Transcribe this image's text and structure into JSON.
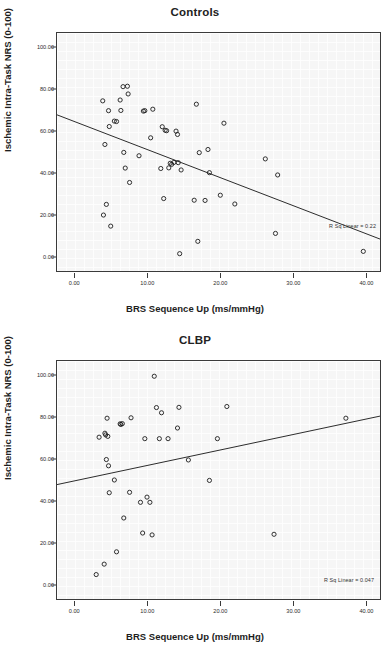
{
  "figure": {
    "axis_x_label": "BRS Sequence Up (ms/mmHg)",
    "axis_y_label": "Ischemic Intra-Task NRS (0-100)",
    "xticks": [
      "0.00",
      "10.00",
      "20.00",
      "30.00",
      "40.00"
    ],
    "yticks": [
      "0.00",
      "20.00",
      "40.00",
      "60.00",
      "80.00",
      "100.00"
    ]
  },
  "chart_data": [
    {
      "type": "scatter",
      "title": "Controls",
      "xlabel": "BRS Sequence Up (ms/mmHg)",
      "ylabel": "Ischemic Intra-Task NRS (0-100)",
      "xlim": [
        -2.5,
        42.0
      ],
      "ylim": [
        -7.0,
        107.0
      ],
      "xticks": [
        0,
        10,
        20,
        30,
        40
      ],
      "yticks": [
        0,
        20,
        40,
        60,
        80,
        100
      ],
      "grid": true,
      "annotation": "R Sq Linear = 0.22",
      "fit_line": {
        "x0": -2.5,
        "y0": 67.8,
        "x1": 42.0,
        "y1": 8.3
      },
      "points": [
        {
          "x": 3.8,
          "y": 74.5
        },
        {
          "x": 3.9,
          "y": 19.8
        },
        {
          "x": 4.1,
          "y": 53.6
        },
        {
          "x": 4.3,
          "y": 24.9
        },
        {
          "x": 4.6,
          "y": 69.8
        },
        {
          "x": 4.7,
          "y": 62.2
        },
        {
          "x": 4.9,
          "y": 14.5
        },
        {
          "x": 5.4,
          "y": 64.8
        },
        {
          "x": 5.7,
          "y": 64.6
        },
        {
          "x": 6.2,
          "y": 74.9
        },
        {
          "x": 6.3,
          "y": 69.9
        },
        {
          "x": 6.6,
          "y": 81.3
        },
        {
          "x": 6.7,
          "y": 49.8
        },
        {
          "x": 6.9,
          "y": 42.3
        },
        {
          "x": 7.2,
          "y": 81.5
        },
        {
          "x": 7.3,
          "y": 77.8
        },
        {
          "x": 7.5,
          "y": 35.4
        },
        {
          "x": 8.8,
          "y": 48.2
        },
        {
          "x": 9.4,
          "y": 69.6
        },
        {
          "x": 9.6,
          "y": 69.8
        },
        {
          "x": 10.4,
          "y": 56.8
        },
        {
          "x": 10.7,
          "y": 70.5
        },
        {
          "x": 11.8,
          "y": 42.1
        },
        {
          "x": 12.0,
          "y": 62.1
        },
        {
          "x": 12.2,
          "y": 27.7
        },
        {
          "x": 12.4,
          "y": 60.4
        },
        {
          "x": 12.6,
          "y": 60.2
        },
        {
          "x": 12.9,
          "y": 42.4
        },
        {
          "x": 13.1,
          "y": 44.6
        },
        {
          "x": 13.3,
          "y": 44.1
        },
        {
          "x": 13.6,
          "y": 45.0
        },
        {
          "x": 13.9,
          "y": 60.0
        },
        {
          "x": 14.1,
          "y": 58.4
        },
        {
          "x": 14.2,
          "y": 44.9
        },
        {
          "x": 14.4,
          "y": 1.3
        },
        {
          "x": 14.6,
          "y": 41.4
        },
        {
          "x": 16.4,
          "y": 26.9
        },
        {
          "x": 16.7,
          "y": 72.9
        },
        {
          "x": 16.9,
          "y": 7.2
        },
        {
          "x": 17.1,
          "y": 49.7
        },
        {
          "x": 17.9,
          "y": 26.8
        },
        {
          "x": 18.3,
          "y": 51.2
        },
        {
          "x": 18.5,
          "y": 40.1
        },
        {
          "x": 20.0,
          "y": 29.3
        },
        {
          "x": 20.5,
          "y": 63.8
        },
        {
          "x": 22.0,
          "y": 25.1
        },
        {
          "x": 26.2,
          "y": 46.7
        },
        {
          "x": 27.6,
          "y": 11.0
        },
        {
          "x": 27.9,
          "y": 39.0
        },
        {
          "x": 39.7,
          "y": 2.4
        }
      ]
    },
    {
      "type": "scatter",
      "title": "CLBP",
      "xlabel": "BRS Sequence Up (ms/mmHg)",
      "ylabel": "Ischemic Intra-Task NRS (0-100)",
      "xlim": [
        -2.5,
        42.0
      ],
      "ylim": [
        -7.0,
        107.0
      ],
      "xticks": [
        0,
        10,
        20,
        30,
        40
      ],
      "yticks": [
        0,
        20,
        40,
        60,
        80,
        100
      ],
      "grid": true,
      "annotation": "R Sq Linear = 0.047",
      "fit_line": {
        "x0": -2.5,
        "y0": 47.8,
        "x1": 42.0,
        "y1": 80.6
      },
      "points": [
        {
          "x": 2.9,
          "y": 4.7
        },
        {
          "x": 3.3,
          "y": 70.5
        },
        {
          "x": 4.0,
          "y": 9.7
        },
        {
          "x": 4.1,
          "y": 72.4
        },
        {
          "x": 4.2,
          "y": 71.6
        },
        {
          "x": 4.3,
          "y": 59.8
        },
        {
          "x": 4.4,
          "y": 79.6
        },
        {
          "x": 4.5,
          "y": 70.9
        },
        {
          "x": 4.6,
          "y": 56.8
        },
        {
          "x": 4.7,
          "y": 43.9
        },
        {
          "x": 5.4,
          "y": 50.0
        },
        {
          "x": 5.7,
          "y": 15.6
        },
        {
          "x": 6.2,
          "y": 76.9
        },
        {
          "x": 6.3,
          "y": 76.6
        },
        {
          "x": 6.5,
          "y": 77.0
        },
        {
          "x": 6.7,
          "y": 31.8
        },
        {
          "x": 7.5,
          "y": 44.1
        },
        {
          "x": 7.7,
          "y": 79.8
        },
        {
          "x": 9.0,
          "y": 39.3
        },
        {
          "x": 9.3,
          "y": 24.6
        },
        {
          "x": 9.6,
          "y": 69.8
        },
        {
          "x": 9.9,
          "y": 41.8
        },
        {
          "x": 10.3,
          "y": 39.3
        },
        {
          "x": 10.6,
          "y": 23.7
        },
        {
          "x": 10.9,
          "y": 99.7
        },
        {
          "x": 11.2,
          "y": 84.7
        },
        {
          "x": 11.6,
          "y": 69.8
        },
        {
          "x": 11.9,
          "y": 82.2
        },
        {
          "x": 12.8,
          "y": 69.8
        },
        {
          "x": 14.1,
          "y": 74.9
        },
        {
          "x": 14.3,
          "y": 84.8
        },
        {
          "x": 15.6,
          "y": 59.6
        },
        {
          "x": 18.5,
          "y": 49.8
        },
        {
          "x": 19.6,
          "y": 69.8
        },
        {
          "x": 20.9,
          "y": 85.2
        },
        {
          "x": 27.4,
          "y": 24.0
        },
        {
          "x": 37.3,
          "y": 79.6
        }
      ]
    }
  ]
}
